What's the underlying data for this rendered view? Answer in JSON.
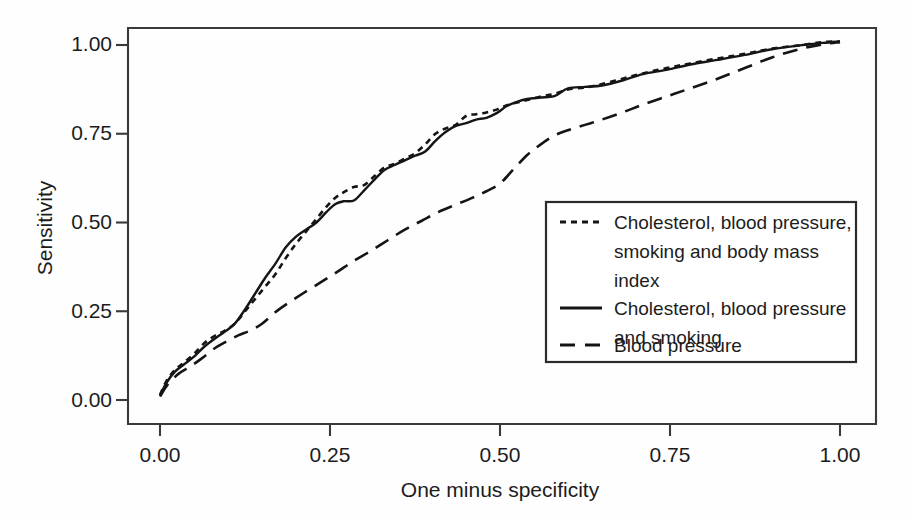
{
  "chart_data": {
    "type": "line",
    "title": "",
    "xlabel": "One minus specificity",
    "ylabel": "Sensitivity",
    "xlim": [
      0.0,
      1.0
    ],
    "ylim": [
      0.0,
      1.0
    ],
    "xticks": [
      "0.00",
      "0.25",
      "0.50",
      "0.75",
      "1.00"
    ],
    "yticks": [
      "0.00",
      "0.25",
      "0.50",
      "0.75",
      "1.00"
    ],
    "xtick_values": [
      0.0,
      0.25,
      0.5,
      0.75,
      1.0
    ],
    "ytick_values": [
      0.0,
      0.25,
      0.5,
      0.75,
      1.0
    ],
    "grid": false,
    "legend_position": "lower-right",
    "series": [
      {
        "name": "Cholesterol, blood pressure, smoking and body mass index",
        "style": "dotted",
        "x": [
          0.0,
          0.01,
          0.022,
          0.035,
          0.05,
          0.065,
          0.08,
          0.095,
          0.11,
          0.125,
          0.14,
          0.155,
          0.17,
          0.185,
          0.2,
          0.215,
          0.23,
          0.245,
          0.258,
          0.27,
          0.285,
          0.3,
          0.315,
          0.33,
          0.345,
          0.36,
          0.375,
          0.39,
          0.405,
          0.42,
          0.435,
          0.45,
          0.465,
          0.48,
          0.495,
          0.51,
          0.525,
          0.54,
          0.56,
          0.58,
          0.6,
          0.625,
          0.65,
          0.68,
          0.71,
          0.745,
          0.78,
          0.82,
          0.86,
          0.9,
          0.945,
          0.975,
          1.0
        ],
        "y": [
          0.015,
          0.055,
          0.085,
          0.105,
          0.13,
          0.16,
          0.18,
          0.195,
          0.215,
          0.25,
          0.285,
          0.32,
          0.355,
          0.4,
          0.44,
          0.475,
          0.51,
          0.545,
          0.57,
          0.585,
          0.6,
          0.605,
          0.63,
          0.655,
          0.665,
          0.68,
          0.695,
          0.72,
          0.75,
          0.765,
          0.775,
          0.8,
          0.805,
          0.81,
          0.818,
          0.83,
          0.838,
          0.845,
          0.855,
          0.862,
          0.875,
          0.88,
          0.89,
          0.905,
          0.92,
          0.935,
          0.948,
          0.962,
          0.975,
          0.99,
          1.0,
          1.008,
          1.01
        ]
      },
      {
        "name": "Cholesterol, blood pressure and smoking",
        "style": "solid",
        "x": [
          0.0,
          0.01,
          0.022,
          0.035,
          0.05,
          0.065,
          0.08,
          0.095,
          0.11,
          0.125,
          0.14,
          0.155,
          0.17,
          0.185,
          0.2,
          0.215,
          0.23,
          0.245,
          0.258,
          0.27,
          0.285,
          0.3,
          0.315,
          0.33,
          0.345,
          0.36,
          0.375,
          0.39,
          0.405,
          0.42,
          0.435,
          0.45,
          0.465,
          0.48,
          0.495,
          0.51,
          0.525,
          0.54,
          0.56,
          0.58,
          0.6,
          0.625,
          0.65,
          0.68,
          0.71,
          0.745,
          0.78,
          0.82,
          0.86,
          0.9,
          0.945,
          0.975,
          1.0
        ],
        "y": [
          0.012,
          0.05,
          0.08,
          0.1,
          0.122,
          0.15,
          0.172,
          0.192,
          0.215,
          0.255,
          0.3,
          0.345,
          0.385,
          0.43,
          0.46,
          0.48,
          0.5,
          0.53,
          0.552,
          0.56,
          0.562,
          0.59,
          0.62,
          0.648,
          0.662,
          0.675,
          0.688,
          0.7,
          0.73,
          0.755,
          0.772,
          0.78,
          0.79,
          0.795,
          0.808,
          0.828,
          0.84,
          0.848,
          0.852,
          0.856,
          0.878,
          0.882,
          0.886,
          0.9,
          0.918,
          0.93,
          0.945,
          0.958,
          0.972,
          0.988,
          1.0,
          1.006,
          1.01
        ]
      },
      {
        "name": "Blood pressure",
        "style": "dashed",
        "x": [
          0.0,
          0.012,
          0.028,
          0.045,
          0.062,
          0.08,
          0.098,
          0.115,
          0.132,
          0.15,
          0.17,
          0.19,
          0.21,
          0.235,
          0.26,
          0.285,
          0.31,
          0.335,
          0.36,
          0.385,
          0.41,
          0.435,
          0.46,
          0.48,
          0.5,
          0.52,
          0.54,
          0.56,
          0.58,
          0.6,
          0.625,
          0.65,
          0.68,
          0.71,
          0.745,
          0.78,
          0.82,
          0.86,
          0.9,
          0.94,
          0.975,
          1.0
        ],
        "y": [
          0.01,
          0.045,
          0.075,
          0.095,
          0.118,
          0.145,
          0.165,
          0.182,
          0.195,
          0.215,
          0.248,
          0.275,
          0.3,
          0.33,
          0.36,
          0.392,
          0.42,
          0.45,
          0.48,
          0.505,
          0.53,
          0.55,
          0.57,
          0.588,
          0.61,
          0.65,
          0.69,
          0.72,
          0.745,
          0.76,
          0.775,
          0.79,
          0.81,
          0.832,
          0.855,
          0.878,
          0.905,
          0.935,
          0.965,
          0.988,
          1.002,
          1.008
        ]
      }
    ],
    "legend": [
      {
        "style": "dotted",
        "lines": [
          "Cholesterol, blood pressure,",
          "smoking and body mass",
          "index"
        ]
      },
      {
        "style": "solid",
        "lines": [
          "Cholesterol, blood pressure",
          "and smoking"
        ]
      },
      {
        "style": "dashed",
        "lines": [
          "Blood pressure"
        ]
      }
    ],
    "colors": {
      "line": "#151515",
      "axis": "#3a3a3a",
      "background": "#fefefe",
      "text": "#1c1c1c"
    }
  }
}
